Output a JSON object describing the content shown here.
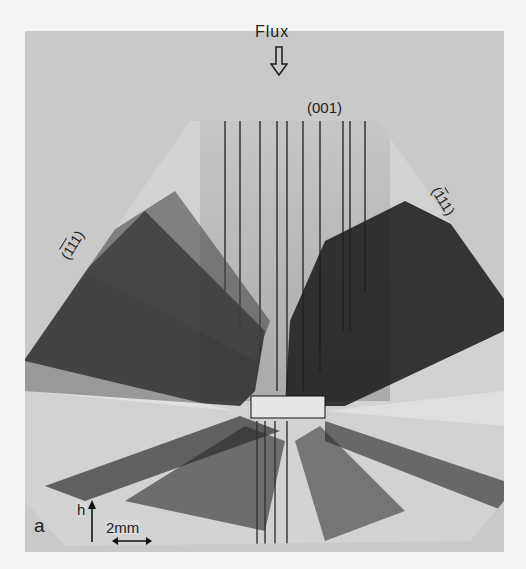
{
  "figure": {
    "panel_label": "a",
    "flux_label": "Flux",
    "plane_top": "(001)",
    "plane_left": {
      "prefix": "(",
      "bar1": "1",
      "bar2": "1",
      "plain": "1",
      "suffix": ")"
    },
    "plane_right": {
      "prefix": "(",
      "bar1": "1",
      "plain": "11",
      "suffix": ")"
    },
    "growth_direction_label": "h",
    "scale_bar_label": "2mm",
    "colors": {
      "background": "#f4f4f4",
      "photo_background": "#c9c9c9",
      "crystal_light": "#d2d2d2",
      "dislocation_dark": "#1e1e1e",
      "seed": "#e6e6e6"
    }
  }
}
